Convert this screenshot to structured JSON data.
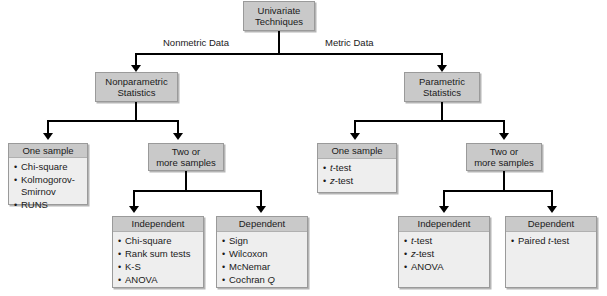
{
  "diagram": {
    "root": {
      "label": "Univariate\nTechniques"
    },
    "edge_labels": {
      "left": "Nonmetric Data",
      "right": "Metric Data"
    },
    "branches": [
      {
        "name": "nonparametric",
        "node": {
          "label": "Nonparametric\nStatistics"
        },
        "one_sample": {
          "title": "One sample",
          "items": [
            "Chi-square",
            "Kolmogorov-\nSmirnov",
            "RUNS"
          ]
        },
        "two_or_more": {
          "title": "Two or\nmore samples"
        },
        "independent": {
          "title": "Independent",
          "items": [
            "Chi-square",
            "Rank sum tests",
            "K-S",
            "ANOVA"
          ]
        },
        "dependent": {
          "title": "Dependent",
          "items": [
            "Sign",
            "Wilcoxon",
            "McNemar",
            "Cochran Q"
          ]
        }
      },
      {
        "name": "parametric",
        "node": {
          "label": "Parametric\nStatistics"
        },
        "one_sample": {
          "title": "One sample",
          "items": [
            "t-test",
            "z-test"
          ]
        },
        "two_or_more": {
          "title": "Two or\nmore samples"
        },
        "independent": {
          "title": "Independent",
          "items": [
            "t-test",
            "z-test",
            "ANOVA"
          ]
        },
        "dependent": {
          "title": "Dependent",
          "items": [
            "Paired t-test"
          ]
        }
      }
    ],
    "colors": {
      "box_fill": "#c9c9c9",
      "list_body": "#eeeeee",
      "border": "#9a9a9a",
      "connector": "#000000",
      "text": "#1a1a1a",
      "background": "#ffffff"
    }
  }
}
